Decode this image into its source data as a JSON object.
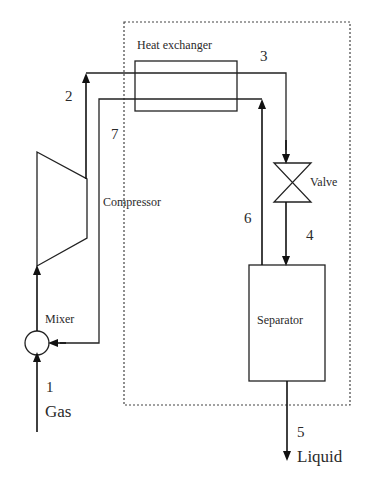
{
  "diagram": {
    "title": "",
    "components": {
      "heat_exchanger": "Heat exchanger",
      "compressor": "Compressor",
      "valve": "Valve",
      "mixer": "Mixer",
      "separator": "Separator"
    },
    "streams": {
      "s1": "1",
      "s2": "2",
      "s3": "3",
      "s4": "4",
      "s5": "5",
      "s6": "6",
      "s7": "7"
    },
    "io": {
      "inlet": "Gas",
      "outlet": "Liquid"
    },
    "colors": {
      "line": "#222222",
      "boundary": "#444444",
      "background": "#ffffff"
    }
  }
}
